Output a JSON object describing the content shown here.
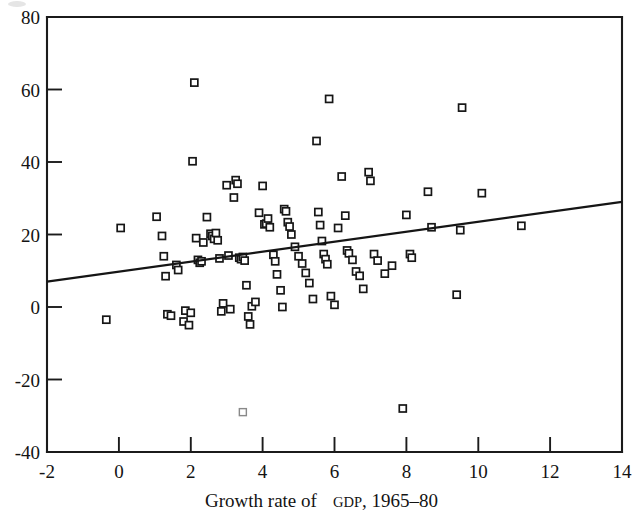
{
  "figure": {
    "caption_top_artifact": "",
    "background_color": "#ffffff",
    "ink_color": "#161616"
  },
  "chart_data": {
    "type": "scatter",
    "title": "",
    "subtitle": "",
    "xlabel": "Growth rate of GDP, 1965-80",
    "xlabel_parts": {
      "before": "Growth rate of ",
      "smallcaps": "GDP",
      "after": ", 1965–80"
    },
    "ylabel": "",
    "xlim": [
      -2,
      14
    ],
    "ylim": [
      -40,
      80
    ],
    "xticks": [
      -2,
      0,
      2,
      4,
      6,
      8,
      10,
      12,
      14
    ],
    "xtick_labels": [
      "-2",
      "0",
      "2",
      "4",
      "6",
      "8",
      "10",
      "12",
      "14"
    ],
    "yticks": [
      -40,
      -20,
      0,
      20,
      40,
      60,
      80
    ],
    "ytick_labels": [
      "-40",
      "-20",
      "0",
      "20",
      "40",
      "60",
      "80"
    ],
    "grid": false,
    "legend": null,
    "marker_style": "open-square",
    "marker_size_px": 7,
    "trend_line": {
      "type": "linear-fit",
      "label": "",
      "x_start": -2,
      "y_start": 7.0,
      "x_end": 14,
      "y_end": 29.0,
      "slope": 1.375,
      "intercept": 9.75
    },
    "points": [
      [
        -0.35,
        -3.5
      ],
      [
        0.05,
        21.8
      ],
      [
        1.05,
        24.9
      ],
      [
        1.2,
        19.6
      ],
      [
        1.25,
        14.0
      ],
      [
        1.3,
        8.5
      ],
      [
        1.35,
        -2.0
      ],
      [
        1.45,
        -2.4
      ],
      [
        1.6,
        11.6
      ],
      [
        1.65,
        10.2
      ],
      [
        1.8,
        -4.0
      ],
      [
        1.85,
        -1.0
      ],
      [
        1.95,
        -5.0
      ],
      [
        2.0,
        -1.6
      ],
      [
        2.05,
        40.2
      ],
      [
        2.1,
        61.9
      ],
      [
        2.15,
        19.0
      ],
      [
        2.2,
        13.0
      ],
      [
        2.25,
        12.2
      ],
      [
        2.3,
        12.6
      ],
      [
        2.35,
        17.8
      ],
      [
        2.45,
        24.8
      ],
      [
        2.55,
        20.2
      ],
      [
        2.6,
        19.6
      ],
      [
        2.65,
        18.8
      ],
      [
        2.7,
        20.4
      ],
      [
        2.75,
        18.4
      ],
      [
        2.8,
        13.4
      ],
      [
        2.85,
        -1.2
      ],
      [
        2.9,
        1.0
      ],
      [
        3.0,
        33.6
      ],
      [
        3.05,
        14.2
      ],
      [
        3.1,
        -0.6
      ],
      [
        3.2,
        30.2
      ],
      [
        3.25,
        35.0
      ],
      [
        3.3,
        34.0
      ],
      [
        3.35,
        13.6
      ],
      [
        3.4,
        13.2
      ],
      [
        3.45,
        13.8
      ],
      [
        3.5,
        12.8
      ],
      [
        3.55,
        6.0
      ],
      [
        3.6,
        -2.6
      ],
      [
        3.65,
        -4.8
      ],
      [
        3.7,
        0.2
      ],
      [
        3.8,
        1.4
      ],
      [
        3.9,
        26.0
      ],
      [
        4.0,
        33.4
      ],
      [
        4.05,
        22.8
      ],
      [
        4.1,
        23.0
      ],
      [
        4.15,
        24.4
      ],
      [
        4.2,
        22.0
      ],
      [
        4.3,
        14.4
      ],
      [
        4.35,
        12.6
      ],
      [
        4.4,
        9.0
      ],
      [
        4.5,
        4.6
      ],
      [
        4.55,
        0.0
      ],
      [
        4.6,
        27.0
      ],
      [
        4.65,
        26.4
      ],
      [
        4.7,
        23.4
      ],
      [
        4.75,
        22.2
      ],
      [
        4.8,
        20.0
      ],
      [
        4.9,
        16.6
      ],
      [
        5.0,
        14.0
      ],
      [
        5.1,
        12.0
      ],
      [
        5.2,
        9.4
      ],
      [
        5.3,
        6.6
      ],
      [
        5.4,
        2.2
      ],
      [
        5.5,
        45.8
      ],
      [
        5.55,
        26.2
      ],
      [
        5.6,
        22.6
      ],
      [
        5.65,
        18.2
      ],
      [
        5.7,
        14.6
      ],
      [
        5.75,
        13.2
      ],
      [
        5.8,
        11.8
      ],
      [
        5.85,
        57.4
      ],
      [
        5.9,
        3.0
      ],
      [
        6.0,
        0.6
      ],
      [
        6.1,
        21.8
      ],
      [
        6.2,
        36.0
      ],
      [
        6.3,
        25.2
      ],
      [
        6.35,
        15.6
      ],
      [
        6.4,
        14.8
      ],
      [
        6.5,
        13.0
      ],
      [
        6.6,
        9.8
      ],
      [
        6.7,
        8.6
      ],
      [
        6.8,
        5.0
      ],
      [
        6.95,
        37.2
      ],
      [
        7.0,
        34.8
      ],
      [
        7.1,
        14.6
      ],
      [
        7.2,
        12.8
      ],
      [
        7.4,
        9.2
      ],
      [
        7.6,
        11.4
      ],
      [
        7.9,
        -28.0
      ],
      [
        8.0,
        25.4
      ],
      [
        8.1,
        14.6
      ],
      [
        8.15,
        13.6
      ],
      [
        8.6,
        31.8
      ],
      [
        8.7,
        22.0
      ],
      [
        9.4,
        3.4
      ],
      [
        9.5,
        21.2
      ],
      [
        9.55,
        55.0
      ],
      [
        10.1,
        31.4
      ],
      [
        11.2,
        22.4
      ],
      [
        3.45,
        -29.0
      ]
    ],
    "n_points": 104,
    "faint_points": [
      [
        3.45,
        -29.0
      ]
    ]
  }
}
